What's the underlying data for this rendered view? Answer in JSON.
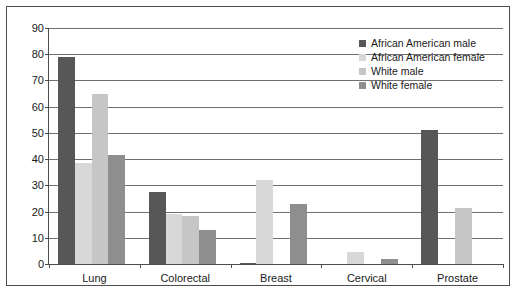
{
  "chart_data": {
    "type": "bar",
    "title": "",
    "subtitle": "",
    "xlabel": "",
    "ylabel": "",
    "ylim": [
      0,
      90
    ],
    "ytick_step": 10,
    "yticks": [
      0,
      10,
      20,
      30,
      40,
      50,
      60,
      70,
      80,
      90
    ],
    "grid": true,
    "grid_axis": "y",
    "legend_position": "top-right",
    "categories": [
      "Lung",
      "Colorectal",
      "Breast",
      "Cervical",
      "Prostate"
    ],
    "series": [
      {
        "name": "African American male",
        "color": "#575757",
        "values": [
          79,
          27.5,
          0.5,
          0,
          51
        ]
      },
      {
        "name": "African American female",
        "color": "#d8d8d8",
        "values": [
          38.5,
          19,
          32,
          4.5,
          0
        ]
      },
      {
        "name": "White male",
        "color": "#c6c6c6",
        "values": [
          65,
          18.5,
          0,
          0,
          21.5
        ]
      },
      {
        "name": "White female",
        "color": "#8e8e8e",
        "values": [
          41.5,
          13,
          23,
          2,
          0
        ]
      }
    ]
  },
  "axes": {
    "y_tick_labels": [
      "90",
      "80",
      "70",
      "60",
      "50",
      "40",
      "30",
      "20",
      "10",
      "0"
    ],
    "x_tick_labels": [
      "Lung",
      "Colorectal",
      "Breast",
      "Cervical",
      "Prostate"
    ]
  },
  "legend": {
    "entries": [
      {
        "label": "African American male",
        "color": "#575757"
      },
      {
        "label": "African American female",
        "color": "#d8d8d8"
      },
      {
        "label": "White male",
        "color": "#c6c6c6"
      },
      {
        "label": "White female",
        "color": "#8e8e8e"
      }
    ]
  },
  "style": {
    "background": "#ffffff",
    "axis_color": "#4d4d4d",
    "grid_color": "#6f6f6f",
    "text_color": "#1a1a1a"
  }
}
